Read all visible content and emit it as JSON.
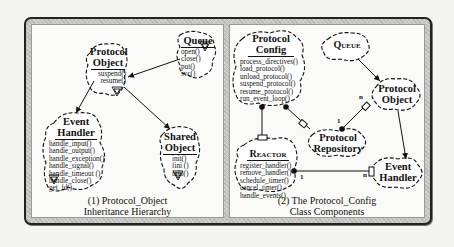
{
  "figure": {
    "panels": [
      {
        "id": "left",
        "caption_line1": "(1) Protocol_Object",
        "caption_line2": "Inheritance Hierarchy",
        "classes": {
          "queue": {
            "title": "Queue",
            "methods": [
              "open()",
              "close()",
              "put()",
              "svc()"
            ]
          },
          "protocol_object": {
            "title_line1": "Protocol",
            "title_line2": "Object",
            "methods": [
              "suspend()",
              "resume()"
            ]
          },
          "event_handler": {
            "title_line1": "Event",
            "title_line2": "Handler",
            "methods": [
              "handle_input()",
              "handle_output()",
              "handle_exception()",
              "handle_signal()",
              "handle_timeout ()",
              "handle_close()",
              "get_fd()"
            ]
          },
          "shared_object": {
            "title_line1": "Shared",
            "title_line2": "Object",
            "methods": [
              "init()",
              "fini ()",
              "info()"
            ]
          }
        }
      },
      {
        "id": "right",
        "caption_line1": "(2)  The  Protocol_Config",
        "caption_line2": "Class Components",
        "classes": {
          "protocol_config": {
            "title_line1": "Protocol",
            "title_line2": "Config",
            "methods": [
              "process_directives()",
              "load_protocol()",
              "unload_protocol()",
              "suspend_protocol()",
              "resume_protocol()",
              "run_event_loop()"
            ]
          },
          "queue": {
            "title": "Queue"
          },
          "protocol_object": {
            "title_line1": "Protocol",
            "title_line2": "Object"
          },
          "protocol_repository": {
            "title_line1": "Protocol",
            "title_line2": "Repository"
          },
          "reactor": {
            "title": "Reactor",
            "methods": [
              "register_handler()",
              "remove_handler()",
              "schedule_timer()",
              "cancel_timer()",
              "handle_events()"
            ]
          },
          "event_handler": {
            "title_line1": "Event",
            "title_line2": "Handler"
          }
        },
        "multiplicities": {
          "repo_to_object_n": "n",
          "repo_to_object_1": "1",
          "reactor_to_handler_1": "1",
          "reactor_to_handler_n": "n"
        }
      }
    ]
  }
}
